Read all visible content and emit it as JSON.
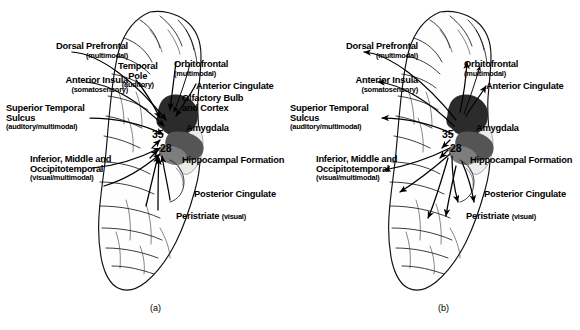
{
  "figure": {
    "type": "neuroanatomical-diagram",
    "panels": [
      {
        "id": "a",
        "caption": "(a)",
        "direction": "afferent",
        "labels": [
          {
            "id": "dorsal-prefrontal",
            "main": "Dorsal Prefrontal",
            "sub": "(multimodal)",
            "side": "left"
          },
          {
            "id": "anterior-insula",
            "main": "Anterior Insula",
            "sub": "(somatosensory)",
            "side": "left"
          },
          {
            "id": "superior-temporal-sulcus",
            "main": "Superior Temporal",
            "main2": "Sulcus",
            "sub": "(auditory/multimodal)",
            "side": "left"
          },
          {
            "id": "inferior-middle-occipitotemporal",
            "main": "Inferior, Middle and",
            "main2": "Occipitotemporal",
            "sub": "(visual/multimodal)",
            "side": "left"
          },
          {
            "id": "temporal-pole",
            "main": "Temporal",
            "main2": "Pole",
            "sub": "(auditory)",
            "side": "center"
          },
          {
            "id": "orbitofrontal",
            "main": "Orbitofrontal",
            "sub": "(multimodal)",
            "side": "right"
          },
          {
            "id": "anterior-cingulate",
            "main": "Anterior Cingulate",
            "sub": "",
            "side": "right"
          },
          {
            "id": "olfactory-bulb-and-cortex",
            "main": "Olfactory Bulb",
            "main2": "and Cortex",
            "sub": "",
            "side": "right"
          },
          {
            "id": "amygdala",
            "main": "Amygdala",
            "sub": "",
            "side": "right"
          },
          {
            "id": "hippocampal-formation",
            "main": "Hippocampal Formation",
            "sub": "",
            "side": "right"
          },
          {
            "id": "posterior-cingulate",
            "main": "Posterior Cingulate",
            "sub": "",
            "side": "right"
          },
          {
            "id": "peristriate",
            "main": "Peristriate",
            "sub": "(visual)",
            "side": "right"
          }
        ],
        "area_numbers": [
          "35",
          "28"
        ]
      },
      {
        "id": "b",
        "caption": "(b)",
        "direction": "efferent",
        "labels": [
          {
            "id": "dorsal-prefrontal",
            "main": "Dorsal Prefrontal",
            "sub": "(multimodal)",
            "side": "left"
          },
          {
            "id": "anterior-insula",
            "main": "Anterior Insula",
            "sub": "(somatosensory)",
            "side": "left"
          },
          {
            "id": "superior-temporal-sulcus",
            "main": "Superior Temporal",
            "main2": "Sulcus",
            "sub": "(auditory/multimodal)",
            "side": "left"
          },
          {
            "id": "inferior-middle-occipitotemporal",
            "main": "Inferior, Middle and",
            "main2": "Occipitotemporal",
            "sub": "(visual/multimodal)",
            "side": "left"
          },
          {
            "id": "orbitofrontal",
            "main": "Orbitofrontal",
            "sub": "(multimodal)",
            "side": "right"
          },
          {
            "id": "anterior-cingulate",
            "main": "Anterior Cingulate",
            "sub": "",
            "side": "right"
          },
          {
            "id": "amygdala",
            "main": "Amygdala",
            "sub": "",
            "side": "right"
          },
          {
            "id": "hippocampal-formation",
            "main": "Hippocampal Formation",
            "sub": "",
            "side": "right"
          },
          {
            "id": "posterior-cingulate",
            "main": "Posterior Cingulate",
            "sub": "",
            "side": "right"
          },
          {
            "id": "peristriate",
            "main": "Peristriate",
            "sub": "(visual)",
            "side": "right"
          }
        ],
        "area_numbers": [
          "35",
          "28"
        ]
      }
    ],
    "colors": {
      "ink": "#000000",
      "background": "#ffffff",
      "shading": "#2b2b2b"
    }
  }
}
